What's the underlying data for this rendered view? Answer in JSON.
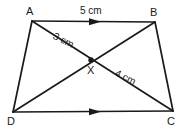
{
  "figure": {
    "background_color": "#ffffff",
    "stroke_color": "#1a1a1a",
    "vertices": [
      {
        "name": "A",
        "label": "A",
        "x": 32,
        "y": 21
      },
      {
        "name": "B",
        "label": "B",
        "x": 155,
        "y": 22
      },
      {
        "name": "C",
        "label": "C",
        "x": 173,
        "y": 111
      },
      {
        "name": "D",
        "label": "D",
        "x": 13,
        "y": 112
      }
    ],
    "intersection": {
      "name": "X",
      "label": "X",
      "x": 91,
      "y": 60,
      "dot_radius": 2.6
    },
    "sides": [
      {
        "name": "AB",
        "from": "A",
        "to": "B",
        "has_arrow_marker": true
      },
      {
        "name": "BC",
        "from": "B",
        "to": "C",
        "has_arrow_marker": false
      },
      {
        "name": "DC",
        "from": "D",
        "to": "C",
        "has_arrow_marker": true
      },
      {
        "name": "AD",
        "from": "A",
        "to": "D",
        "has_arrow_marker": false
      }
    ],
    "diagonals": [
      {
        "name": "AC",
        "from": "A",
        "to": "C"
      },
      {
        "name": "BD",
        "from": "B",
        "to": "D"
      }
    ],
    "measurements": [
      {
        "name": "side-ab-length",
        "text": "5 cm",
        "applies_to": "AB"
      },
      {
        "name": "segment-ax-length",
        "text": "3 cm",
        "applies_to": "AX"
      },
      {
        "name": "segment-xc-length",
        "text": "4 cm",
        "applies_to": "XC"
      }
    ],
    "parallel_marks": {
      "count": 1,
      "description": "single arrowhead on AB and on DC indicating AB parallel to DC"
    }
  }
}
